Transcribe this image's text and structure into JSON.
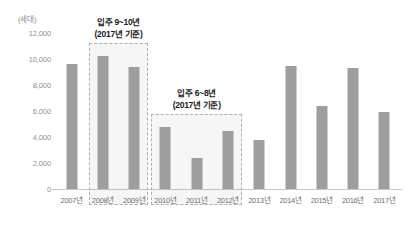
{
  "chart_data": {
    "type": "bar",
    "title": "",
    "subtitle": "",
    "unit_label": "(세대)",
    "xlabel": "",
    "ylabel": "",
    "ylim": [
      0,
      12000
    ],
    "ytick_step": 2000,
    "grid": false,
    "legend": "none",
    "bar_color": "#9e9e9e",
    "categories": [
      "2007년",
      "2008년",
      "2009년",
      "2010년",
      "2011년",
      "2012년",
      "2013년",
      "2014년",
      "2015년",
      "2016년",
      "2017년"
    ],
    "values": [
      9600,
      10200,
      9400,
      4800,
      2400,
      4500,
      3800,
      9500,
      6400,
      9300,
      5900
    ],
    "ytick_labels": [
      "0",
      "2,000",
      "4,000",
      "6,000",
      "8,000",
      "10,000",
      "12,000"
    ],
    "ytick_values": [
      0,
      2000,
      4000,
      6000,
      8000,
      10000,
      12000
    ],
    "annotations": [
      {
        "line1": "입주 9~10년",
        "line2": "(2017년 기준)",
        "covers": [
          "2008년",
          "2009년"
        ]
      },
      {
        "line1": "입주 6~8년",
        "line2": "(2017년 기준)",
        "covers": [
          "2010년",
          "2011년",
          "2012년"
        ]
      }
    ]
  }
}
